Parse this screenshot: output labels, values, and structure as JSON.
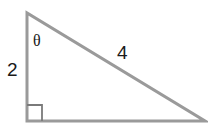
{
  "diagram": {
    "type": "right-triangle",
    "labels": {
      "vertical_side": "2",
      "hypotenuse": "4",
      "angle": "θ"
    },
    "colors": {
      "stroke": "#9a9a9a",
      "text": "#1a1a1a",
      "background": "#ffffff"
    },
    "right_angle_marker": true
  }
}
